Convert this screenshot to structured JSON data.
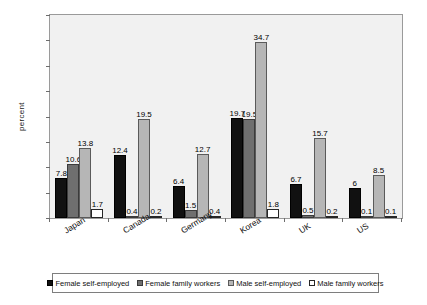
{
  "chart_data": {
    "type": "bar",
    "title": "",
    "xlabel": "",
    "ylabel": "percent",
    "ylim": [
      0,
      40
    ],
    "ytick_step": 5,
    "yticks": [
      40,
      35,
      30,
      25,
      20,
      15,
      10,
      5,
      0
    ],
    "grid": false,
    "legend_position": "bottom",
    "categories": [
      "Japan",
      "Canada",
      "Germany",
      "Korea",
      "UK",
      "US"
    ],
    "series": [
      {
        "name": "Female self-employed",
        "color": "#111111",
        "values": [
          7.8,
          12.4,
          6.4,
          19.7,
          6.7,
          6
        ],
        "labels": [
          "7.8",
          "12.4",
          "6.4",
          "19.7",
          "6.7",
          "6"
        ]
      },
      {
        "name": "Female family workers",
        "color": "#6f6f6f",
        "values": [
          10.6,
          0.4,
          1.5,
          19.5,
          0.5,
          0.1
        ],
        "labels": [
          "10.6",
          "0.4",
          "1.5",
          "19.5",
          "0.5",
          "0.1"
        ]
      },
      {
        "name": "Male self-employed",
        "color": "#b6b6b6",
        "values": [
          13.8,
          19.5,
          12.7,
          34.7,
          15.7,
          8.5
        ],
        "labels": [
          "13.8",
          "19.5",
          "12.7",
          "34.7",
          "15.7",
          "8.5"
        ]
      },
      {
        "name": "Male family workers",
        "color": "#ffffff",
        "values": [
          1.7,
          0.2,
          0.4,
          1.8,
          0.2,
          0.1
        ],
        "labels": [
          "1.7",
          "0.2",
          "0.4",
          "1.8",
          "0.2",
          "0.1"
        ]
      }
    ]
  }
}
